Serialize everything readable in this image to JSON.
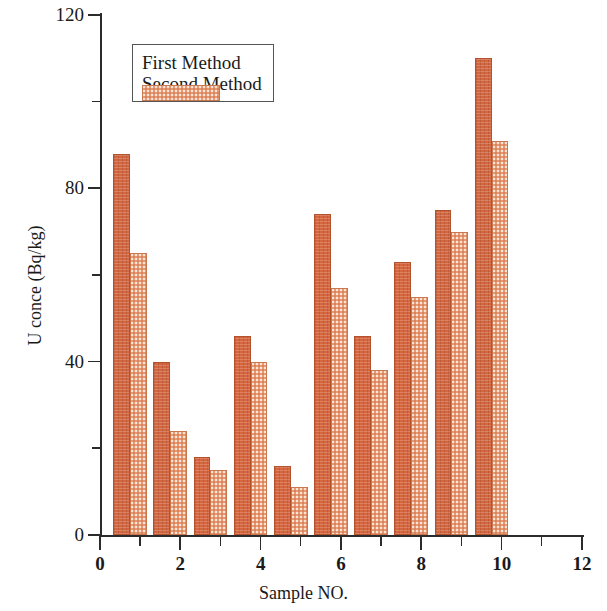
{
  "chart_data": {
    "type": "bar",
    "title": "",
    "xlabel": "Sample NO.",
    "ylabel": "U conce (Bq/kg)",
    "categories": [
      1,
      2,
      3,
      4,
      5,
      6,
      7,
      8,
      9,
      10
    ],
    "series": [
      {
        "name": "First Method",
        "color": "#d4673f",
        "values": [
          88,
          40,
          18,
          46,
          16,
          74,
          46,
          63,
          75,
          110
        ]
      },
      {
        "name": "Second Method",
        "color": "#e89a73",
        "values": [
          65,
          24,
          15,
          40,
          11,
          57,
          38,
          55,
          70,
          91
        ]
      }
    ],
    "xlim": [
      0,
      12
    ],
    "ylim": [
      0,
      120
    ],
    "x_major_ticks": [
      0,
      2,
      4,
      6,
      8,
      10,
      12
    ],
    "x_minor_ticks": [
      1,
      3,
      5,
      7,
      9,
      11
    ],
    "x_tick_labels": [
      "0",
      "2",
      "4",
      "6",
      "8",
      "10",
      "12"
    ],
    "y_major_ticks": [
      0,
      40,
      80,
      120
    ],
    "y_minor_ticks": [
      20,
      60,
      100
    ],
    "y_tick_labels": [
      "0",
      "40",
      "80",
      "120"
    ],
    "grid": false,
    "legend_position": "top-left",
    "legend": [
      "First Method",
      "Second Method"
    ]
  }
}
